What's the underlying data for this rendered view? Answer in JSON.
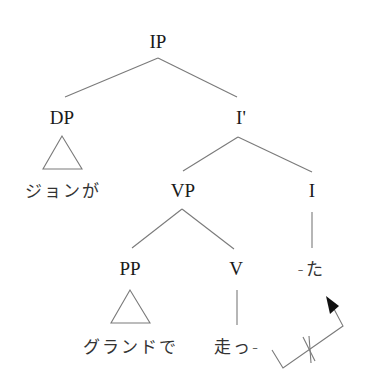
{
  "diagram": {
    "type": "syntax-tree",
    "nodes": {
      "ip": "IP",
      "dp": "DP",
      "i_bar": "I'",
      "dp_text": "ジョンが",
      "vp": "VP",
      "i": "I",
      "pp": "PP",
      "v": "V",
      "i_text": "-た",
      "pp_text": "グランドで",
      "v_text": "走っ-"
    },
    "edges": [
      [
        "IP",
        "DP"
      ],
      [
        "IP",
        "I'"
      ],
      [
        "I'",
        "VP"
      ],
      [
        "I'",
        "I"
      ],
      [
        "VP",
        "PP"
      ],
      [
        "VP",
        "V"
      ],
      [
        "I",
        "-た"
      ],
      [
        "V",
        "走っ-"
      ]
    ],
    "triangles": [
      "DP",
      "PP"
    ],
    "movement_arrow": {
      "from": "走っ-",
      "to": "-た",
      "blocked": true
    },
    "colors": {
      "line": "#777777",
      "text": "#1a1a1a"
    }
  }
}
